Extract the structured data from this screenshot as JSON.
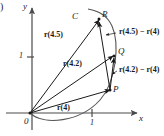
{
  "figure": {
    "caption_fragment": ")",
    "axes": {
      "x_label": "x",
      "y_label": "y",
      "origin_label": "0",
      "x_tick_label": "1",
      "y_tick_label": "1"
    },
    "curve": {
      "label": "C"
    },
    "points": [
      {
        "name": "P",
        "label": "P"
      },
      {
        "name": "Q",
        "label": "Q"
      },
      {
        "name": "R",
        "label": "R"
      }
    ],
    "position_vectors": [
      {
        "name": "r-of-4",
        "label": "r(4)"
      },
      {
        "name": "r-of-4p2",
        "label": "r(4.2)"
      },
      {
        "name": "r-of-4p5",
        "label": "r(4.5)"
      }
    ],
    "secant_vectors": [
      {
        "name": "secant-4p2",
        "label": "r(4.2) − r(4)"
      },
      {
        "name": "secant-4p5",
        "label": "r(4.5) − r(4)"
      }
    ],
    "colors": {
      "ink": "#1a1a1a",
      "axis": "#4a4a4a",
      "background": "#ffffff"
    }
  }
}
